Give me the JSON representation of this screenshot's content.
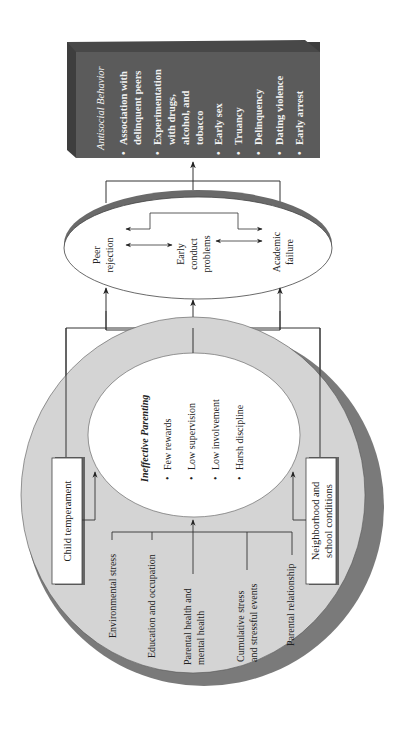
{
  "outcome": {
    "title": "Antisocial Behavior",
    "items": [
      [
        "Association with",
        "delinquent peers"
      ],
      [
        "Experimentation",
        "with drugs,",
        "alcohol, and",
        "tobacco"
      ],
      [
        "Early sex"
      ],
      [
        "Truancy"
      ],
      [
        "Delinquency"
      ],
      [
        "Dating violence"
      ],
      [
        "Early arrest"
      ]
    ],
    "item_text": {
      "i0a": "Association with",
      "i0b": "delinquent peers",
      "i1a": "Experimentation",
      "i1b": "with drugs,",
      "i1c": "alcohol, and",
      "i1d": "tobacco",
      "i2": "Early sex",
      "i3": "Truancy",
      "i4": "Delinquency",
      "i5": "Dating violence",
      "i6": "Early arrest"
    }
  },
  "early_problems": {
    "peer": [
      "Peer",
      "rejection"
    ],
    "conduct": [
      "Early",
      "conduct",
      "problems"
    ],
    "academic": [
      "Academic",
      "failure"
    ]
  },
  "parenting": {
    "title": "Ineffective Parenting",
    "items": [
      "Few rewards",
      "Low supervision",
      "Low involvement",
      "Harsh discipline"
    ]
  },
  "context": {
    "child": "Child temperament",
    "neighborhood": [
      "Neighborhood and",
      "school conditions"
    ],
    "factors": {
      "env": "Environmental stress",
      "edu": "Education and occupation",
      "health": [
        "Parental health and",
        "mental health"
      ],
      "stress": [
        "Cumulative stress",
        "and stressful events"
      ],
      "rel": "Parental relationship"
    }
  },
  "colors": {
    "box_dark": "#5b5b5b",
    "outer_circle": "#d4d4d4",
    "shadow": "#7a7a7a",
    "line": "#333333"
  }
}
